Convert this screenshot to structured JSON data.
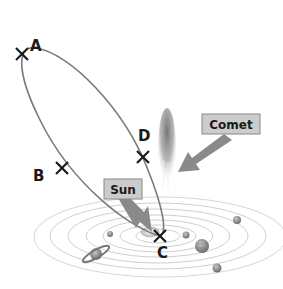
{
  "diagram": {
    "points": [
      {
        "id": "A",
        "label": "A",
        "x": 22,
        "y": 54,
        "label_x": 32,
        "label_y": 50
      },
      {
        "id": "B",
        "label": "B",
        "x": 62,
        "y": 168,
        "label_x": 33,
        "label_y": 180
      },
      {
        "id": "C",
        "label": "C",
        "x": 160,
        "y": 236,
        "label_x": 160,
        "label_y": 256
      },
      {
        "id": "D",
        "label": "D",
        "x": 143,
        "y": 157,
        "label_x": 139,
        "label_y": 141
      }
    ],
    "callouts": [
      {
        "id": "comet",
        "label": "Comet"
      },
      {
        "id": "sun",
        "label": "Sun"
      }
    ],
    "colors": {
      "orbit": "#777777",
      "marker": "#1a1a1a",
      "callout_bg": "#cccccc",
      "callout_border": "#888888",
      "arrow": "#8a8a8a",
      "solar_orbits": "#c8c8c8",
      "planet": "#9a9a9a"
    }
  }
}
